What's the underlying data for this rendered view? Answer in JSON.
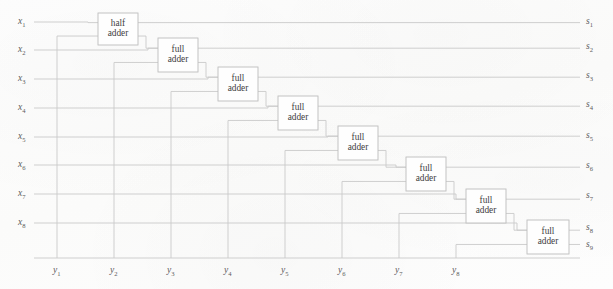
{
  "diagram": {
    "line_color": "#c9c9c9",
    "box_border_color": "#bdbdbd",
    "text_color": "#3f3f3f",
    "label_color": "#5c5c5c",
    "background_color": "#fdfdfc"
  },
  "inputs_left": [
    {
      "name": "x1",
      "base": "x",
      "sub": "1",
      "y": 22
    },
    {
      "name": "x2",
      "base": "x",
      "sub": "2",
      "y": 50
    },
    {
      "name": "x3",
      "base": "x",
      "sub": "3",
      "y": 79
    },
    {
      "name": "x4",
      "base": "x",
      "sub": "4",
      "y": 108
    },
    {
      "name": "x5",
      "base": "x",
      "sub": "5",
      "y": 137
    },
    {
      "name": "x6",
      "base": "x",
      "sub": "6",
      "y": 165
    },
    {
      "name": "x7",
      "base": "x",
      "sub": "7",
      "y": 194
    },
    {
      "name": "x8",
      "base": "x",
      "sub": "8",
      "y": 223
    }
  ],
  "inputs_bottom": [
    {
      "name": "y1",
      "base": "y",
      "sub": "1",
      "x": 57
    },
    {
      "name": "y2",
      "base": "y",
      "sub": "2",
      "x": 114
    },
    {
      "name": "y3",
      "base": "y",
      "sub": "3",
      "x": 171
    },
    {
      "name": "y4",
      "base": "y",
      "sub": "4",
      "x": 228
    },
    {
      "name": "y5",
      "base": "y",
      "sub": "5",
      "x": 285
    },
    {
      "name": "y6",
      "base": "y",
      "sub": "6",
      "x": 342
    },
    {
      "name": "y7",
      "base": "y",
      "sub": "7",
      "x": 399
    },
    {
      "name": "y8",
      "base": "y",
      "sub": "8",
      "x": 456
    }
  ],
  "outputs_right": [
    {
      "name": "s1",
      "base": "s",
      "sub": "1",
      "y": 22
    },
    {
      "name": "s2",
      "base": "s",
      "sub": "2",
      "y": 47
    },
    {
      "name": "s3",
      "base": "s",
      "sub": "3",
      "y": 76
    },
    {
      "name": "s4",
      "base": "s",
      "sub": "4",
      "y": 105
    },
    {
      "name": "s5",
      "base": "s",
      "sub": "5",
      "y": 136
    },
    {
      "name": "s6",
      "base": "s",
      "sub": "6",
      "y": 166
    },
    {
      "name": "s7",
      "base": "s",
      "sub": "7",
      "y": 196
    },
    {
      "name": "s8",
      "base": "s",
      "sub": "8",
      "y": 228
    },
    {
      "name": "s9",
      "base": "s",
      "sub": "9",
      "y": 245
    }
  ],
  "adders": [
    {
      "id": "adder-1",
      "kind": "half",
      "line1": "half",
      "line2": "adder",
      "x": 98,
      "y": 13,
      "w": 40,
      "h": 32
    },
    {
      "id": "adder-2",
      "kind": "full",
      "line1": "full",
      "line2": "adder",
      "x": 158,
      "y": 38,
      "w": 40,
      "h": 34
    },
    {
      "id": "adder-3",
      "kind": "full",
      "line1": "full",
      "line2": "adder",
      "x": 218,
      "y": 67,
      "w": 40,
      "h": 34
    },
    {
      "id": "adder-4",
      "kind": "full",
      "line1": "full",
      "line2": "adder",
      "x": 278,
      "y": 96,
      "w": 40,
      "h": 34
    },
    {
      "id": "adder-5",
      "kind": "full",
      "line1": "full",
      "line2": "adder",
      "x": 338,
      "y": 126,
      "w": 40,
      "h": 34
    },
    {
      "id": "adder-6",
      "kind": "full",
      "line1": "full",
      "line2": "adder",
      "x": 406,
      "y": 157,
      "w": 40,
      "h": 34
    },
    {
      "id": "adder-7",
      "kind": "full",
      "line1": "full",
      "line2": "adder",
      "x": 466,
      "y": 189,
      "w": 40,
      "h": 34
    },
    {
      "id": "adder-8",
      "kind": "full",
      "line1": "full",
      "line2": "adder",
      "x": 527,
      "y": 220,
      "w": 42,
      "h": 34
    }
  ]
}
